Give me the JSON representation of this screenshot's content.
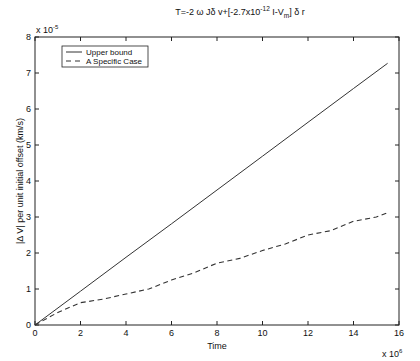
{
  "chart_data": {
    "type": "line",
    "title_parts": {
      "main": "T=-2 ω Jδ v+[-2.7x10",
      "exp": "-12",
      "mid": " I-V",
      "sub": "m",
      "tail": "] δ r"
    },
    "xlabel": "Time",
    "ylabel": "|Δ V| per unit initial offset (km/s)",
    "x_multiplier": "x 10",
    "x_multiplier_exp": "6",
    "y_multiplier": "x 10",
    "y_multiplier_exp": "-5",
    "xlim": [
      0,
      16
    ],
    "ylim": [
      0,
      8
    ],
    "xticks": [
      "0",
      "2",
      "4",
      "6",
      "8",
      "10",
      "12",
      "14",
      "16"
    ],
    "yticks": [
      "0",
      "1",
      "2",
      "3",
      "4",
      "5",
      "6",
      "7",
      "8"
    ],
    "grid": false,
    "legend_position": "upper left",
    "series": [
      {
        "name": "Upper bound",
        "style": "solid",
        "x": [
          0,
          2,
          4,
          6,
          8,
          10,
          12,
          14,
          15.5
        ],
        "y": [
          0,
          0.94,
          1.88,
          2.81,
          3.75,
          4.69,
          5.63,
          6.57,
          7.27
        ]
      },
      {
        "name": "A Specific Case",
        "style": "dashed",
        "x": [
          0,
          1,
          2,
          3,
          4,
          5,
          6,
          7,
          8,
          9,
          10,
          11,
          12,
          13,
          14,
          15,
          15.5
        ],
        "y": [
          0,
          0.35,
          0.62,
          0.72,
          0.86,
          1.0,
          1.25,
          1.45,
          1.72,
          1.85,
          2.07,
          2.25,
          2.5,
          2.62,
          2.88,
          3.0,
          3.12
        ]
      }
    ]
  }
}
